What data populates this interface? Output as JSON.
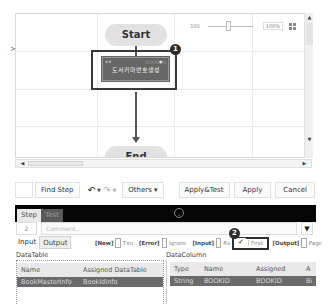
{
  "canvas": {
    "expander_glyph": ">",
    "start_label": "Start",
    "end_label": "End",
    "process": {
      "header_left": "##",
      "header_right": "○○○○●○",
      "title": "도서키마번호생성"
    },
    "badge_1": "1",
    "zoom": {
      "value": "100",
      "percent": "100%",
      "fit_icon": "fit-screen-icon"
    }
  },
  "scrollbars": {
    "up": "▲",
    "down": "▼",
    "left": "◀",
    "right": "▶"
  },
  "toolbar": {
    "find_step": "Find Step",
    "undo_icon": "↶",
    "redo_icon": "↷",
    "others": "Others ▾",
    "apply_test": "Apply&Test",
    "apply": "Apply",
    "cancel": "Cancel"
  },
  "panel": {
    "tabs": [
      "Step",
      "Test"
    ],
    "collapse_icon": "⌄",
    "step_number": "2",
    "comment_placeholder": "Comment...",
    "comment_dropdown": "▼",
    "io_tabs": [
      "Input",
      "Output"
    ],
    "options": {
      "new_tag": "[New]",
      "txn_label": "Txn",
      "txn_checked": false,
      "error_tag": "[Error]",
      "ignore_label": "Ignore",
      "ignore_checked": false,
      "input_tag": "[Input]",
      "rs_label": "Rs",
      "rs_checked": false,
      "first_label": "First",
      "first_checked": true,
      "first_check_glyph": "✓",
      "output_tag": "[Output]",
      "page_label": "Page",
      "page_checked": false
    },
    "badge_2": "2"
  },
  "datatable": {
    "label": "DataTable",
    "columns": [
      "Name",
      "Assigned DataTable"
    ],
    "rows": [
      [
        "BookMasterInfo",
        "BookIdInfo"
      ]
    ]
  },
  "datacolumn": {
    "label": "DataColumn",
    "columns": [
      "Type",
      "Name",
      "Assigned",
      "A"
    ],
    "rows": [
      [
        "String",
        "BOOKID",
        "BOOKID",
        "Bi"
      ]
    ]
  }
}
